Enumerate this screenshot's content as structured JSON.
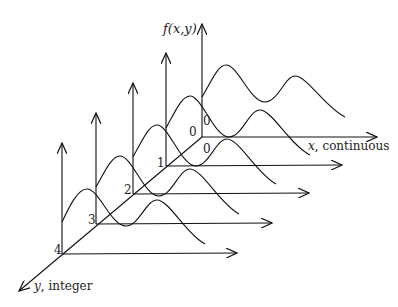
{
  "diagram": {
    "z_axis_label": "f(x,y)",
    "x_axis_label": "x",
    "x_axis_suffix": ", continuous",
    "y_axis_label": "y",
    "y_axis_suffix": ", integer",
    "back_labels": {
      "left_zero": "0",
      "axis_zero": "0",
      "below_zero": "0"
    },
    "slices": [
      {
        "index": 0,
        "label": "0",
        "origin": [
          202,
          137
        ]
      },
      {
        "index": 1,
        "label": "1",
        "origin": [
          166,
          166
        ]
      },
      {
        "index": 2,
        "label": "2",
        "origin": [
          133,
          194
        ]
      },
      {
        "index": 3,
        "label": "3",
        "origin": [
          96,
          224
        ]
      },
      {
        "index": 4,
        "label": "4",
        "origin": [
          62,
          254
        ]
      }
    ],
    "line_color": "#111111",
    "text_color": "#222222"
  }
}
